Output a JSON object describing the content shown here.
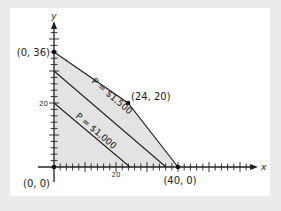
{
  "chart_data": {
    "type": "line",
    "title": "",
    "xlabel": "x",
    "ylabel": "y",
    "xlim": [
      0,
      65
    ],
    "ylim": [
      0,
      44
    ],
    "x_tick_labels": [
      "20"
    ],
    "y_tick_labels": [
      "20"
    ],
    "grid": false,
    "feasible_region": {
      "vertices": [
        [
          0,
          0
        ],
        [
          0,
          36
        ],
        [
          24,
          20
        ],
        [
          40,
          0
        ]
      ],
      "fill": "#e3e3e3"
    },
    "points": [
      {
        "label": "(0, 0)",
        "x": 0,
        "y": 0
      },
      {
        "label": "(0, 36)",
        "x": 0,
        "y": 36
      },
      {
        "label": "(24, 20)",
        "x": 24,
        "y": 20
      },
      {
        "label": "(40, 0)",
        "x": 40,
        "y": 0
      }
    ],
    "series": [
      {
        "name": "P = $1,500",
        "x": [
          0,
          36
        ],
        "y": [
          30,
          0
        ]
      },
      {
        "name": "P = $1,000",
        "x": [
          0,
          24
        ],
        "y": [
          20,
          0
        ]
      }
    ]
  },
  "labels": {
    "origin": "(0, 0)",
    "y_intercept": "(0, 36)",
    "corner": "(24, 20)",
    "x_intercept": "(40, 0)",
    "p1500": "P = $1,500",
    "p1000": "P = $1,000",
    "x_axis": "x",
    "y_axis": "y",
    "x_tick_20": "20",
    "y_tick_20": "20"
  }
}
